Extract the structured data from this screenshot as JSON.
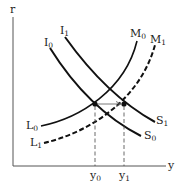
{
  "diagram": {
    "axes": {
      "y_label": "r",
      "x_label": "y"
    },
    "curves": [
      {
        "id": "I0",
        "label": "I",
        "sub": "0",
        "end_label": "S",
        "end_sub": "0",
        "style": "solid"
      },
      {
        "id": "I1",
        "label": "I",
        "sub": "1",
        "end_label": "S",
        "end_sub": "1",
        "style": "solid"
      },
      {
        "id": "M0",
        "label": "M",
        "sub": "0",
        "start_label": "L",
        "start_sub": "0",
        "style": "solid"
      },
      {
        "id": "M1",
        "label": "M",
        "sub": "1",
        "start_label": "L",
        "start_sub": "1",
        "style": "dashed"
      }
    ],
    "x_ticks": [
      {
        "label": "y",
        "sub": "0"
      },
      {
        "label": "y",
        "sub": "1"
      }
    ],
    "colors": {
      "line": "#111111",
      "axis": "#555555",
      "guide": "#444444"
    }
  }
}
